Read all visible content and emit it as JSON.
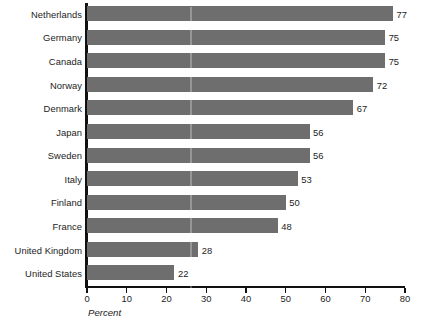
{
  "chart_data": {
    "type": "bar",
    "orientation": "horizontal",
    "title": "",
    "subtitle": "",
    "xlabel": "Percent",
    "ylabel": "",
    "categories": [
      "Netherlands",
      "Germany",
      "Canada",
      "Norway",
      "Denmark",
      "Japan",
      "Sweden",
      "Italy",
      "Finland",
      "France",
      "United Kingdom",
      "United States"
    ],
    "values": [
      77,
      75,
      75,
      72,
      67,
      56,
      56,
      53,
      50,
      48,
      28,
      22
    ],
    "value_labels": [
      "77",
      "75",
      "75",
      "72",
      "67",
      "56",
      "56",
      "53",
      "50",
      "48",
      "28",
      "22"
    ],
    "xlim": [
      0,
      80
    ],
    "xticks": [
      0,
      10,
      20,
      30,
      40,
      50,
      60,
      70,
      80
    ],
    "xtick_labels": [
      "0",
      "10",
      "20",
      "30",
      "40",
      "50",
      "60",
      "70",
      "80"
    ],
    "grid": false,
    "legend": null,
    "bar_color": "#6e6e6e",
    "axis_color": "#111111",
    "text_color": "#1c1c1c",
    "background": "#ffffff"
  }
}
